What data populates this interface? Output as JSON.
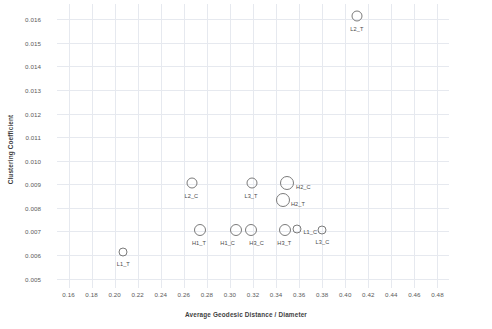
{
  "chart_data": {
    "type": "scatter",
    "title": "",
    "xlabel": "Average Geodesic Distance / Diameter",
    "ylabel": "Clustering Coefficient",
    "xlim": [
      0.15,
      0.49
    ],
    "ylim": [
      0.0046,
      0.01665
    ],
    "grid": true,
    "legend": "none",
    "xticks": [
      "0.16",
      "0.18",
      "0.20",
      "0.22",
      "0.24",
      "0.26",
      "0.28",
      "0.30",
      "0.32",
      "0.34",
      "0.36",
      "0.38",
      "0.40",
      "0.42",
      "0.44",
      "0.46",
      "0.48"
    ],
    "xtick_values": [
      0.16,
      0.18,
      0.2,
      0.22,
      0.24,
      0.26,
      0.28,
      0.3,
      0.32,
      0.34,
      0.36,
      0.38,
      0.4,
      0.42,
      0.44,
      0.46,
      0.48
    ],
    "yticks": [
      "0.005",
      "0.006",
      "0.007",
      "0.008",
      "0.009",
      "0.010",
      "0.011",
      "0.012",
      "0.013",
      "0.014",
      "0.015",
      "0.016"
    ],
    "ytick_values": [
      0.005,
      0.006,
      0.007,
      0.008,
      0.009,
      0.01,
      0.011,
      0.012,
      0.013,
      0.014,
      0.015,
      0.016
    ],
    "points": [
      {
        "label": "L2_T",
        "x": 0.4105,
        "y": 0.01615,
        "size": 11,
        "label_dx": -7,
        "label_dy": 10
      },
      {
        "label": "L2_C",
        "x": 0.2675,
        "y": 0.00905,
        "size": 11,
        "label_dx": -8,
        "label_dy": 10
      },
      {
        "label": "L3_T",
        "x": 0.3195,
        "y": 0.00905,
        "size": 11,
        "label_dx": -8,
        "label_dy": 10
      },
      {
        "label": "H2_C",
        "x": 0.3495,
        "y": 0.00905,
        "size": 14,
        "label_dx": 9,
        "label_dy": 1
      },
      {
        "label": "H2_T",
        "x": 0.346,
        "y": 0.00835,
        "size": 14,
        "label_dx": 8,
        "label_dy": 1
      },
      {
        "label": "H1_T",
        "x": 0.274,
        "y": 0.00705,
        "size": 12,
        "label_dx": -8,
        "label_dy": 10
      },
      {
        "label": "H1_C",
        "x": 0.3055,
        "y": 0.00705,
        "size": 12,
        "label_dx": -16,
        "label_dy": 10
      },
      {
        "label": "H3_C",
        "x": 0.3185,
        "y": 0.00705,
        "size": 12,
        "label_dx": -2,
        "label_dy": 10
      },
      {
        "label": "H3_T",
        "x": 0.348,
        "y": 0.00705,
        "size": 12,
        "label_dx": -8,
        "label_dy": 10
      },
      {
        "label": "L1_C",
        "x": 0.3585,
        "y": 0.0071,
        "size": 9,
        "label_dx": 6,
        "label_dy": 0
      },
      {
        "label": "L3_C",
        "x": 0.3795,
        "y": 0.00705,
        "size": 9,
        "label_dx": -6,
        "label_dy": 9
      },
      {
        "label": "L1_T",
        "x": 0.207,
        "y": 0.00612,
        "size": 9,
        "label_dx": -6,
        "label_dy": 9
      }
    ]
  }
}
